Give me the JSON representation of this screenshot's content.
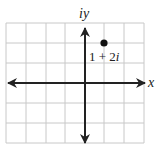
{
  "diagram": {
    "type": "complex-plane",
    "axis_labels": {
      "x": "x",
      "y": "iy"
    },
    "grid": {
      "x_min": -4,
      "x_max": 3,
      "y_min": -3,
      "y_max": 3
    },
    "points": [
      {
        "re": 1,
        "im": 2,
        "label": "1 + 2i",
        "label_main": "1 + 2",
        "label_italic": "i"
      }
    ],
    "colors": {
      "grid": "#c8c8c8",
      "axis": "#222222",
      "point": "#111111"
    }
  }
}
